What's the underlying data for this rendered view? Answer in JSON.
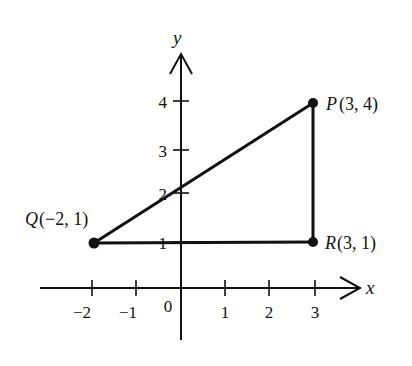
{
  "diagram": {
    "type": "coordinate-plane-triangle",
    "colors": {
      "ink": "#111111",
      "background": "#ffffff"
    },
    "axes": {
      "x_label": "x",
      "y_label": "y",
      "origin_label": "0",
      "x_ticks": [
        {
          "value": -2,
          "label": "−2"
        },
        {
          "value": -1,
          "label": "−1"
        },
        {
          "value": 1,
          "label": "1"
        },
        {
          "value": 2,
          "label": "2"
        },
        {
          "value": 3,
          "label": "3"
        }
      ],
      "y_ticks": [
        {
          "value": 1,
          "label": "1"
        },
        {
          "value": 2,
          "label": "2"
        },
        {
          "value": 3,
          "label": "3"
        },
        {
          "value": 4,
          "label": "4"
        }
      ]
    },
    "points": {
      "P": {
        "name": "P",
        "coords": "(3, 4)",
        "x": 3,
        "y": 4
      },
      "Q": {
        "name": "Q",
        "coords": "(−2, 1)",
        "x": -2,
        "y": 1
      },
      "R": {
        "name": "R",
        "coords": "(3, 1)",
        "x": 3,
        "y": 1
      }
    },
    "segments": [
      "QP",
      "PR",
      "QR"
    ]
  }
}
